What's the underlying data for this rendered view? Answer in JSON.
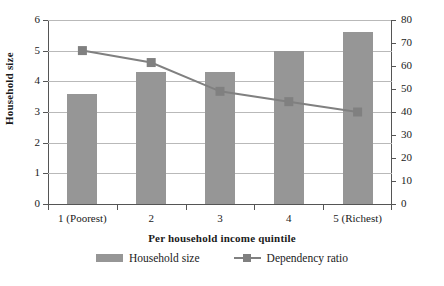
{
  "chart_data": {
    "type": "bar",
    "title": "",
    "categories": [
      "1 (Poorest)",
      "2",
      "3",
      "4",
      "5 (Richest)"
    ],
    "xlabel": "Per household income quintile",
    "ylabel": "Household size",
    "y2label": "Dependency ratio (%)",
    "ylim": [
      0,
      6
    ],
    "y2lim": [
      0,
      80
    ],
    "grid": true,
    "legend_position": "bottom",
    "yticks": [
      "0",
      "1",
      "2",
      "3",
      "4",
      "5",
      "6"
    ],
    "y2ticks": [
      "0",
      "10",
      "20",
      "30",
      "40",
      "50",
      "60",
      "70",
      "80"
    ],
    "series": [
      {
        "name": "Household size",
        "type": "bar",
        "axis": "left",
        "color": "#969696",
        "values": [
          3.6,
          4.3,
          4.3,
          5.0,
          5.6
        ]
      },
      {
        "name": "Dependency ratio",
        "type": "line",
        "axis": "right",
        "color": "#808080",
        "values": [
          66.7,
          61.5,
          49.0,
          44.5,
          40.0
        ]
      }
    ]
  },
  "legend": {
    "items": [
      {
        "label": "Household size",
        "marker": "bar-swatch"
      },
      {
        "label": "Dependency ratio",
        "marker": "line-square-marker"
      }
    ]
  }
}
